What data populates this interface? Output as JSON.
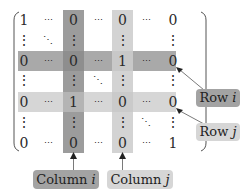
{
  "colors": {
    "column_i_band": "#9c9c9c",
    "column_j_band": "#d3d3d3",
    "row_i_band": "#a9a9a9",
    "row_j_band": "#d6d6d6",
    "intersection_i_i": "#8e8e8e",
    "intersection_i_j": "#c8c8c8",
    "intersection_j_i": "#b4b4b4",
    "intersection_j_j": "#cacaca",
    "label_dark": "#a3a3a3",
    "label_light": "#d6d6d6",
    "arrow": "#7a7a7a",
    "text": "#2a2a2a"
  },
  "matrix": {
    "rows": [
      [
        "1",
        "⋯",
        "0",
        "⋯",
        "0",
        "⋯",
        "0"
      ],
      [
        "⋮",
        "⋱",
        "⋮",
        "",
        "⋮",
        "",
        "⋮"
      ],
      [
        "0",
        "⋯",
        "0",
        "⋯",
        "1",
        "⋯",
        "0"
      ],
      [
        "⋮",
        "",
        "⋮",
        "⋱",
        "⋮",
        "",
        "⋮"
      ],
      [
        "0",
        "⋯",
        "1",
        "⋯",
        "0",
        "⋯",
        "0"
      ],
      [
        "⋮",
        "",
        "⋮",
        "",
        "⋮",
        "⋱",
        "⋮"
      ],
      [
        "0",
        "⋯",
        "0",
        "⋯",
        "0",
        "⋯",
        "1"
      ]
    ],
    "highlighted_row_i_index": 2,
    "highlighted_row_j_index": 4,
    "highlighted_column_i_index": 2,
    "highlighted_column_j_index": 4
  },
  "labels": {
    "row_i": "Row i",
    "row_j": "Row j",
    "column_i": "Column i",
    "column_j": "Column j"
  }
}
